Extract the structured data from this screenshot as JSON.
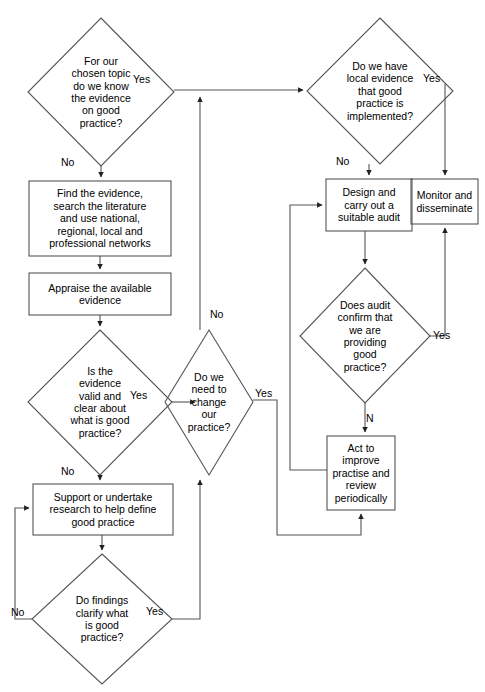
{
  "diagram": {
    "stroke_color": "#555555",
    "text_color": "#000000",
    "background_color": "#ffffff",
    "nodes": [
      {
        "id": "q_know_evidence",
        "shape": "diamond",
        "text": "For our\nchosen topic\ndo we know\nthe evidence\non good\npractice?",
        "x": 28,
        "y": 18,
        "w": 146,
        "h": 148
      },
      {
        "id": "q_local_evidence",
        "shape": "diamond",
        "text": "Do we have\nlocal evidence\nthat good\npractice is\nimplemented?",
        "x": 307,
        "y": 18,
        "w": 146,
        "h": 146
      },
      {
        "id": "box_find_evidence",
        "shape": "rect",
        "text": "Find the evidence,\nsearch the literature\nand use national,\nregional, local and\nprofessional networks",
        "x": 29,
        "y": 181,
        "w": 142,
        "h": 75
      },
      {
        "id": "box_design_audit",
        "shape": "rect",
        "text": "Design and\ncarry out a\nsuitable audit",
        "x": 326,
        "y": 179,
        "w": 86,
        "h": 52
      },
      {
        "id": "box_monitor",
        "shape": "rect",
        "text": "Monitor and\ndisseminate",
        "x": 411,
        "y": 179,
        "w": 67,
        "h": 45
      },
      {
        "id": "box_appraise",
        "shape": "rect",
        "text": "Appraise the available\nevidence",
        "x": 29,
        "y": 273,
        "w": 142,
        "h": 42
      },
      {
        "id": "q_evidence_valid",
        "shape": "diamond",
        "text": "Is the\nevidence\nvalid and\nclear about\nwhat is good\npractice?",
        "x": 28,
        "y": 330,
        "w": 144,
        "h": 145
      },
      {
        "id": "q_need_change",
        "shape": "diamond",
        "text": "Do we\nneed to\nchange\nour\npractice?",
        "x": 165,
        "y": 330,
        "w": 88,
        "h": 145
      },
      {
        "id": "q_audit_confirm",
        "shape": "diamond",
        "text": "Does audit\nconfirm that\nwe are\nproviding\ngood\npractice?",
        "x": 300,
        "y": 268,
        "w": 130,
        "h": 135
      },
      {
        "id": "box_act_improve",
        "shape": "rect",
        "text": "Act to\nimprove\npractise and\nreview\nperiodically",
        "x": 327,
        "y": 436,
        "w": 68,
        "h": 74
      },
      {
        "id": "box_support_research",
        "shape": "rect",
        "text": "Support or undertake\nresearch to help define\ngood practice",
        "x": 33,
        "y": 484,
        "w": 140,
        "h": 51
      },
      {
        "id": "q_findings_clarify",
        "shape": "diamond",
        "text": "Do findings\nclarify what\nis good\npractice?",
        "x": 32,
        "y": 554,
        "w": 140,
        "h": 130
      }
    ],
    "edge_labels": [
      {
        "id": "lbl_yes_know",
        "text": "Yes",
        "x": 133,
        "y": 74
      },
      {
        "id": "lbl_yes_local",
        "text": "Yes",
        "x": 423,
        "y": 73
      },
      {
        "id": "lbl_no_know",
        "text": "No",
        "x": 61,
        "y": 157
      },
      {
        "id": "lbl_no_local",
        "text": "No",
        "x": 336,
        "y": 156
      },
      {
        "id": "lbl_no_change",
        "text": "No",
        "x": 210,
        "y": 309
      },
      {
        "id": "lbl_yes_valid",
        "text": "Yes",
        "x": 130,
        "y": 390
      },
      {
        "id": "lbl_yes_change",
        "text": "Yes",
        "x": 255,
        "y": 388
      },
      {
        "id": "lbl_yes_audit",
        "text": "Yes",
        "x": 433,
        "y": 330
      },
      {
        "id": "lbl_n_audit",
        "text": "N",
        "x": 366,
        "y": 413
      },
      {
        "id": "lbl_no_valid",
        "text": "No",
        "x": 61,
        "y": 466
      },
      {
        "id": "lbl_no_findings",
        "text": "No",
        "x": 11,
        "y": 607
      },
      {
        "id": "lbl_yes_findings",
        "text": "Yes",
        "x": 146,
        "y": 606
      }
    ],
    "caption": {
      "text": "",
      "x": 6,
      "y": 684
    }
  }
}
